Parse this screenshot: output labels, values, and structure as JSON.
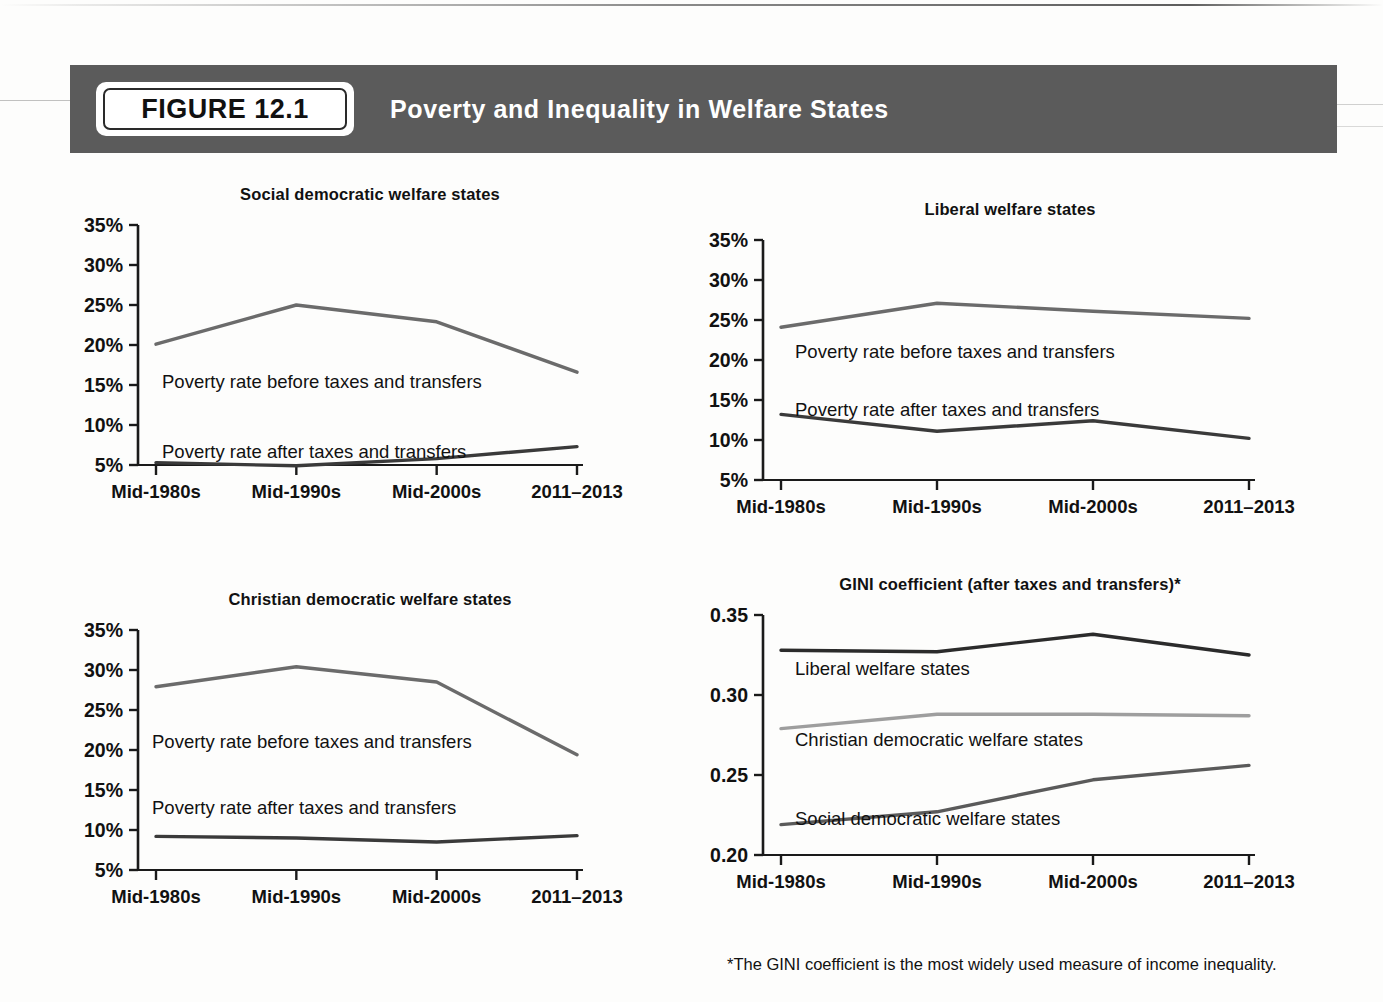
{
  "header": {
    "badge_label": "FIGURE 12.1",
    "title": "Poverty and Inequality in Welfare States",
    "banner_color": "#5b5b5b"
  },
  "footnote": "*The GINI coefficient is the most widely used measure of income inequality.",
  "colors": {
    "before_line": "#6b6b6b",
    "after_line": "#3a3a3a",
    "gini_liberal": "#2b2b2b",
    "gini_christian": "#9e9e9e",
    "gini_social": "#5a5a5a",
    "axis": "#1a1a1a"
  },
  "chart_data": [
    {
      "type": "line",
      "title": "Social democratic welfare states",
      "xlabel": "",
      "ylabel": "",
      "categories": [
        "Mid-1980s",
        "Mid-1990s",
        "Mid-2000s",
        "2011–2013"
      ],
      "ytick_labels": [
        "35%",
        "30%",
        "25%",
        "20%",
        "15%",
        "10%",
        "5%"
      ],
      "ylim": [
        5,
        35
      ],
      "grid": false,
      "legend_position": "inline-annotation",
      "series": [
        {
          "name": "Poverty rate before taxes and transfers",
          "values": [
            20.1,
            25.0,
            22.9,
            16.6
          ],
          "color": "#6b6b6b"
        },
        {
          "name": "Poverty rate after taxes and transfers",
          "values": [
            5.3,
            4.9,
            5.8,
            7.3
          ],
          "color": "#3a3a3a"
        }
      ]
    },
    {
      "type": "line",
      "title": "Liberal welfare states",
      "xlabel": "",
      "ylabel": "",
      "categories": [
        "Mid-1980s",
        "Mid-1990s",
        "Mid-2000s",
        "2011–2013"
      ],
      "ytick_labels": [
        "35%",
        "30%",
        "25%",
        "20%",
        "15%",
        "10%",
        "5%"
      ],
      "ylim": [
        5,
        35
      ],
      "grid": false,
      "legend_position": "inline-annotation",
      "series": [
        {
          "name": "Poverty rate before taxes and transfers",
          "values": [
            24.1,
            27.1,
            26.1,
            25.2
          ],
          "color": "#6b6b6b"
        },
        {
          "name": "Poverty rate after taxes and transfers",
          "values": [
            13.2,
            11.1,
            12.4,
            10.2
          ],
          "color": "#3a3a3a"
        }
      ]
    },
    {
      "type": "line",
      "title": "Christian democratic welfare states",
      "xlabel": "",
      "ylabel": "",
      "categories": [
        "Mid-1980s",
        "Mid-1990s",
        "Mid-2000s",
        "2011–2013"
      ],
      "ytick_labels": [
        "35%",
        "30%",
        "25%",
        "20%",
        "15%",
        "10%",
        "5%"
      ],
      "ylim": [
        5,
        35
      ],
      "grid": false,
      "legend_position": "inline-annotation",
      "series": [
        {
          "name": "Poverty rate before taxes and transfers",
          "values": [
            27.9,
            30.4,
            28.5,
            19.4
          ],
          "color": "#6b6b6b"
        },
        {
          "name": "Poverty rate after taxes and transfers",
          "values": [
            9.2,
            9.0,
            8.5,
            9.3
          ],
          "color": "#3a3a3a"
        }
      ]
    },
    {
      "type": "line",
      "title": "GINI coefficient (after taxes and transfers)*",
      "xlabel": "",
      "ylabel": "",
      "categories": [
        "Mid-1980s",
        "Mid-1990s",
        "Mid-2000s",
        "2011–2013"
      ],
      "ytick_labels": [
        "0.35",
        "0.30",
        "0.25",
        "0.20"
      ],
      "ylim": [
        0.2,
        0.35
      ],
      "grid": false,
      "legend_position": "inline-annotation",
      "series": [
        {
          "name": "Liberal welfare states",
          "values": [
            0.328,
            0.327,
            0.338,
            0.325
          ],
          "color": "#2b2b2b"
        },
        {
          "name": "Christian democratic welfare states",
          "values": [
            0.279,
            0.288,
            0.288,
            0.287
          ],
          "color": "#9e9e9e"
        },
        {
          "name": "Social democratic welfare states",
          "values": [
            0.219,
            0.227,
            0.247,
            0.256
          ],
          "color": "#5a5a5a"
        }
      ]
    }
  ],
  "annotations": {
    "p1_before": "Poverty rate before taxes and transfers",
    "p1_after": "Poverty rate after taxes and transfers",
    "p2_before": "Poverty rate before taxes and transfers",
    "p2_after": "Poverty rate after taxes and transfers",
    "p3_before": "Poverty rate before taxes and transfers",
    "p3_after": "Poverty rate after taxes and transfers",
    "g_liberal": "Liberal welfare states",
    "g_christian": "Christian democratic welfare states",
    "g_social": "Social democratic welfare states"
  }
}
